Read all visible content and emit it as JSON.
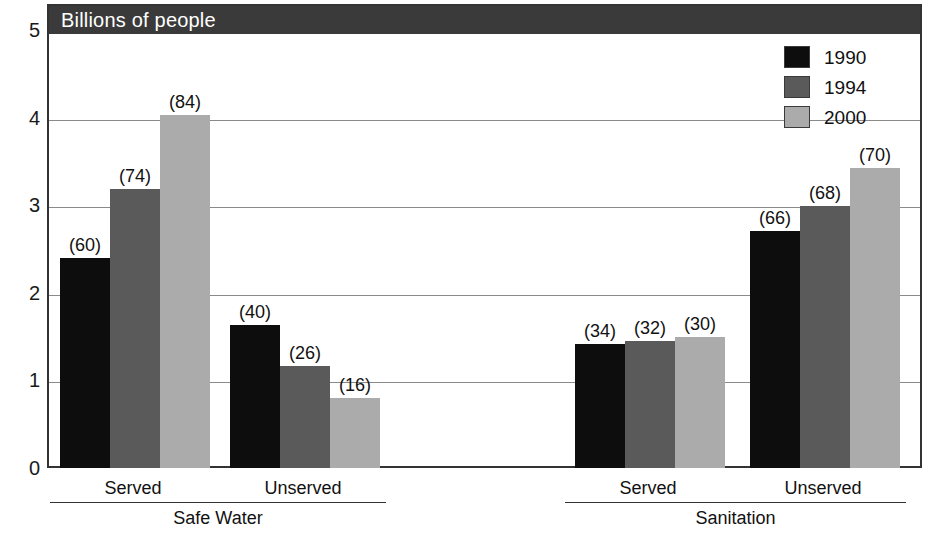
{
  "chart_data": {
    "type": "bar",
    "title": "Billions of people",
    "xlabel": "",
    "ylabel": "Billions of people",
    "ylim": [
      0,
      5
    ],
    "y_ticks": [
      "0",
      "1",
      "2",
      "3",
      "4",
      "5"
    ],
    "grid": true,
    "legend_position": "top-right",
    "legend": [
      "1990",
      "1994",
      "2000"
    ],
    "series": [
      {
        "name": "1990",
        "color": "#0d0d0d",
        "values": [
          2.4,
          1.63,
          1.41,
          2.7
        ],
        "point_labels": [
          "(60)",
          "(40)",
          "(34)",
          "(66)"
        ]
      },
      {
        "name": "1994",
        "color": "#5a5a5a",
        "values": [
          3.18,
          1.16,
          1.45,
          2.99
        ],
        "point_labels": [
          "(74)",
          "(26)",
          "(32)",
          "(68)"
        ]
      },
      {
        "name": "2000",
        "color": "#ababab",
        "values": [
          4.03,
          0.8,
          1.5,
          3.42
        ],
        "point_labels": [
          "(84)",
          "(16)",
          "(30)",
          "(70)"
        ]
      }
    ],
    "categories": [
      "Served",
      "Unserved",
      "Served",
      "Unserved"
    ],
    "supergroups": [
      {
        "label": "Safe Water",
        "categories": [
          "Served",
          "Unserved"
        ]
      },
      {
        "label": "Sanitation",
        "categories": [
          "Served",
          "Unserved"
        ]
      }
    ],
    "annotation_note": "Values in parentheses are percentages of population"
  },
  "axis": {
    "y_ticks": [
      {
        "label": "5",
        "value": 5
      },
      {
        "label": "4",
        "value": 4
      },
      {
        "label": "3",
        "value": 3
      },
      {
        "label": "2",
        "value": 2
      },
      {
        "label": "1",
        "value": 1
      },
      {
        "label": "0",
        "value": 0
      }
    ]
  },
  "title": {
    "text": "Billions of people"
  },
  "legend": {
    "entries": [
      {
        "label": "1990",
        "color": "#0d0d0d"
      },
      {
        "label": "1994",
        "color": "#5a5a5a"
      },
      {
        "label": "2000",
        "color": "#ababab"
      }
    ]
  },
  "groups": [
    {
      "subgroup": "Served",
      "supergroup": "Safe Water",
      "bars": [
        {
          "series": "1990",
          "value": 2.4,
          "label": "(60)"
        },
        {
          "series": "1994",
          "value": 3.18,
          "label": "(74)"
        },
        {
          "series": "2000",
          "value": 4.03,
          "label": "(84)"
        }
      ]
    },
    {
      "subgroup": "Unserved",
      "supergroup": "Safe Water",
      "bars": [
        {
          "series": "1990",
          "value": 1.63,
          "label": "(40)"
        },
        {
          "series": "1994",
          "value": 1.16,
          "label": "(26)"
        },
        {
          "series": "2000",
          "value": 0.8,
          "label": "(16)"
        }
      ]
    },
    {
      "subgroup": "Served",
      "supergroup": "Sanitation",
      "bars": [
        {
          "series": "1990",
          "value": 1.41,
          "label": "(34)"
        },
        {
          "series": "1994",
          "value": 1.45,
          "label": "(32)"
        },
        {
          "series": "2000",
          "value": 1.5,
          "label": "(30)"
        }
      ]
    },
    {
      "subgroup": "Unserved",
      "supergroup": "Sanitation",
      "bars": [
        {
          "series": "1990",
          "value": 2.7,
          "label": "(66)"
        },
        {
          "series": "1994",
          "value": 2.99,
          "label": "(68)"
        },
        {
          "series": "2000",
          "value": 3.42,
          "label": "(70)"
        }
      ]
    }
  ],
  "xaxis": {
    "subgroup_labels": [
      "Served",
      "Unserved",
      "Served",
      "Unserved"
    ],
    "supergroup_labels": [
      "Safe Water",
      "Sanitation"
    ]
  },
  "colors": {
    "series_1990": "#0d0d0d",
    "series_1994": "#5a5a5a",
    "series_2000": "#ababab",
    "title_bar": "#3a3a3a",
    "gridline": "#8a8a8a",
    "frame": "#333333"
  }
}
